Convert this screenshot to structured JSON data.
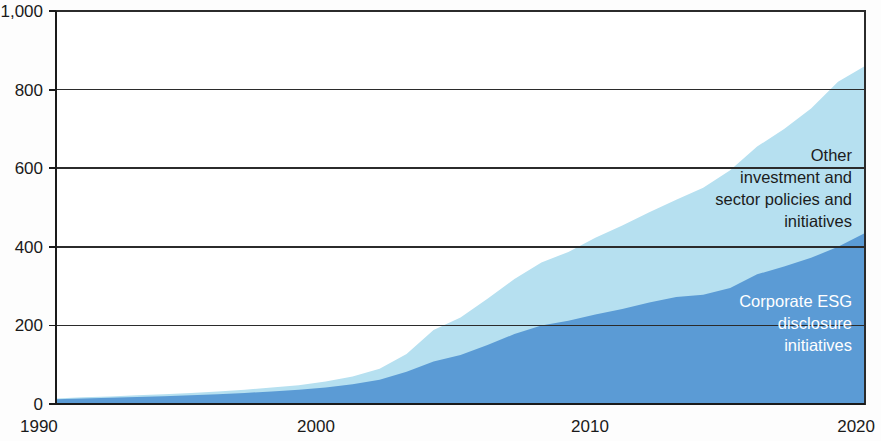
{
  "chart_data": {
    "type": "area",
    "stacked": true,
    "title": "",
    "subtitle": "",
    "xlabel": "",
    "ylabel": "",
    "xlim": [
      1990,
      2020
    ],
    "ylim": [
      0,
      1000
    ],
    "grid": true,
    "grid_axis": "y",
    "legend_position": "inline-annotations",
    "y_ticks": [
      0,
      200,
      400,
      600,
      800,
      1000
    ],
    "y_tick_labels": [
      "0",
      "200",
      "400",
      "600",
      "800",
      "1,000"
    ],
    "x_ticks": [
      1990,
      2000,
      2010,
      2020
    ],
    "x_tick_labels": [
      "1990",
      "2000",
      "2010",
      "2020"
    ],
    "x": [
      1990,
      1991,
      1992,
      1993,
      1994,
      1995,
      1996,
      1997,
      1998,
      1999,
      2000,
      2001,
      2002,
      2003,
      2004,
      2005,
      2006,
      2007,
      2008,
      2009,
      2010,
      2011,
      2012,
      2013,
      2014,
      2015,
      2016,
      2017,
      2018,
      2019,
      2020
    ],
    "series": [
      {
        "name": "Corporate ESG disclosure initiatives",
        "color": "#5b9bd5",
        "values": [
          12,
          14,
          16,
          18,
          20,
          22,
          25,
          28,
          32,
          36,
          42,
          50,
          62,
          82,
          108,
          125,
          150,
          178,
          200,
          212,
          228,
          242,
          258,
          272,
          278,
          295,
          330,
          350,
          372,
          400,
          435
        ]
      },
      {
        "name": "Other investment and sector policies and initiatives",
        "color": "#b6e0f0",
        "values": [
          2,
          3,
          3,
          4,
          5,
          6,
          7,
          8,
          10,
          12,
          15,
          20,
          28,
          45,
          80,
          95,
          118,
          140,
          160,
          175,
          195,
          212,
          230,
          248,
          272,
          300,
          325,
          350,
          380,
          420,
          425
        ]
      }
    ],
    "totals": [
      14,
      17,
      19,
      22,
      25,
      28,
      32,
      36,
      42,
      48,
      57,
      70,
      90,
      127,
      188,
      220,
      268,
      318,
      360,
      387,
      423,
      454,
      488,
      520,
      550,
      595,
      655,
      700,
      752,
      820,
      860
    ],
    "annotations": [
      {
        "name": "other-investment-label",
        "lines": [
          "Other",
          "investment and",
          "sector policies and",
          "initiatives"
        ],
        "text": "Other investment and sector policies and initiatives",
        "series": "Other investment and sector policies and initiatives",
        "text_color": "#1c1c1c"
      },
      {
        "name": "corporate-esg-label",
        "lines": [
          "Corporate ESG",
          "disclosure",
          "initiatives"
        ],
        "text": "Corporate ESG disclosure initiatives",
        "series": "Corporate ESG disclosure initiatives",
        "text_color": "#ffffff"
      }
    ],
    "colors": {
      "series_dark_blue": "#5b9bd5",
      "series_light_blue": "#b6e0f0",
      "axis": "#1a1a1a",
      "grid": "#2b2b2b",
      "background": "#ffffff"
    }
  },
  "axis": {
    "y_labels": [
      "1,000",
      "800",
      "600",
      "400",
      "200",
      "0"
    ],
    "x_labels": [
      "1990",
      "2000",
      "2010",
      "2020"
    ]
  },
  "annotations": {
    "other": {
      "line1": "Other",
      "line2": "investment and",
      "line3": "sector policies and",
      "line4": "initiatives"
    },
    "esg": {
      "line1": "Corporate ESG",
      "line2": "disclosure",
      "line3": "initiatives"
    }
  }
}
